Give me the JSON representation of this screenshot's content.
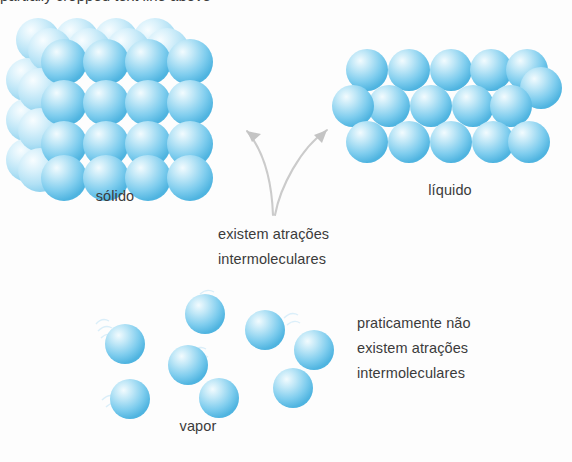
{
  "figure": {
    "title_fragment": "partially cropped text line above",
    "background_color": "#fdfdfd",
    "sphere_color": "#5fbfe8",
    "sphere_highlight": "#eaf7fd",
    "arrow_color": "#c9c9c9",
    "text_color": "#3b3b3b"
  },
  "states": {
    "solid": {
      "label": "sólido",
      "rows": 4,
      "cols": 4,
      "depth_layers": 3,
      "arrangement": "ordered cubic lattice"
    },
    "liquid": {
      "label": "líquido",
      "row_counts": [
        6,
        5,
        6
      ],
      "arrangement": "close packed, irregular rows"
    },
    "vapor": {
      "label": "vapor",
      "sphere_count": 8,
      "arrangement": "widely scattered"
    }
  },
  "annotations": {
    "center": {
      "lines": [
        "existem atrações",
        "intermoleculares"
      ]
    },
    "vapor_note": {
      "lines": [
        "praticamente não",
        "existem atrações",
        "intermoleculares"
      ]
    },
    "arrow": {
      "name": "branching-arrow",
      "targets": [
        "solid",
        "liquid"
      ]
    }
  }
}
